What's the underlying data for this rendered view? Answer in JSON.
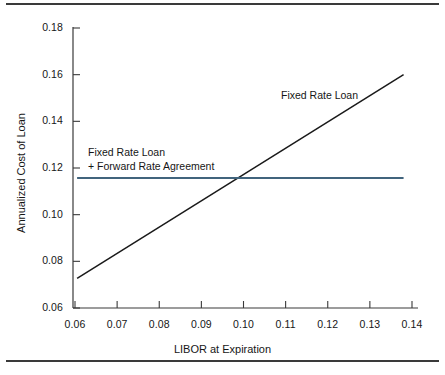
{
  "chart_data": {
    "type": "line",
    "title": "",
    "xlabel": "LIBOR at Expiration",
    "ylabel": "Annualized Cost of Loan",
    "xlim": [
      0.06,
      0.14
    ],
    "ylim": [
      0.06,
      0.18
    ],
    "xticks": [
      "0.06",
      "0.07",
      "0.08",
      "0.09",
      "0.10",
      "0.11",
      "0.12",
      "0.13",
      "0.14"
    ],
    "yticks": [
      "0.06",
      "0.08",
      "0.10",
      "0.12",
      "0.14",
      "0.16",
      "0.18"
    ],
    "xtick_values": [
      0.06,
      0.07,
      0.08,
      0.09,
      0.1,
      0.11,
      0.12,
      0.13,
      0.14
    ],
    "ytick_values": [
      0.06,
      0.08,
      0.1,
      0.12,
      0.14,
      0.16,
      0.18
    ],
    "grid": false,
    "legend": "none",
    "series": [
      {
        "name": "Fixed Rate Loan",
        "color": "#1a1a1a",
        "x": [
          0.0605,
          0.138
        ],
        "values": [
          0.0727,
          0.16
        ],
        "annotation": "Fixed Rate Loan"
      },
      {
        "name": "Fixed Rate Loan + Forward Rate Agreement",
        "color": "#41647d",
        "x": [
          0.0605,
          0.138
        ],
        "values": [
          0.1157,
          0.1157
        ],
        "annotation_line1": "Fixed Rate Loan",
        "annotation_line2": "+ Forward Rate Agreement"
      }
    ],
    "annotations": [
      {
        "id": "fixed-rate-loan",
        "text": "Fixed Rate Loan"
      },
      {
        "id": "fixed-rate-loan-fra",
        "text": "Fixed Rate Loan\n+ Forward Rate Agreement"
      }
    ],
    "crossover_x": 0.0995,
    "crossover_y": 0.1157
  },
  "axes": {
    "x_title": "LIBOR at Expiration",
    "y_title": "Annualized Cost of Loan"
  },
  "colors": {
    "axis": "#3a3a3a",
    "fixed_rate_loan": "#1a1a1a",
    "fra_line": "#41647d",
    "rule": "#3a3a3a",
    "background": "#ffffff"
  }
}
